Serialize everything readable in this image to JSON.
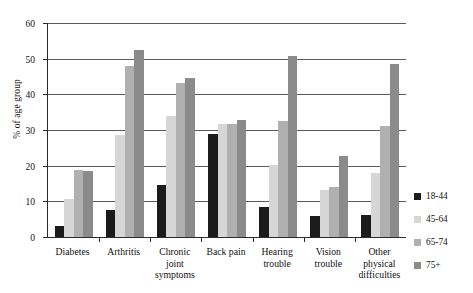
{
  "chart_data": {
    "type": "bar",
    "title": "",
    "subtitle": "",
    "xlabel": "",
    "ylabel": "% of age group",
    "ylim": [
      0,
      60
    ],
    "yticks": [
      0,
      10,
      20,
      30,
      40,
      50,
      60
    ],
    "ytick_labels": [
      "0",
      "10",
      "20",
      "30",
      "40",
      "50",
      "60"
    ],
    "grid": true,
    "legend_position": "right",
    "categories": [
      "Diabetes",
      "Arthritis",
      "Chronic\njoint\nsymptoms",
      "Back pain",
      "Hearing\ntrouble",
      "Vision\ntrouble",
      "Other\nphysical\ndifficulties"
    ],
    "series": [
      {
        "name": "18-44",
        "color": "#1b1b1b",
        "values": [
          3.0,
          7.5,
          14.7,
          29.0,
          8.3,
          6.0,
          6.3
        ]
      },
      {
        "name": "45-64",
        "color": "#d6d6d6",
        "values": [
          10.7,
          28.5,
          34.0,
          31.8,
          20.3,
          13.2,
          18.0
        ]
      },
      {
        "name": "65-74",
        "color": "#b0b0b0",
        "values": [
          18.8,
          48.0,
          43.3,
          31.8,
          32.5,
          14.0,
          31.0
        ]
      },
      {
        "name": "75+",
        "color": "#8b8b8b",
        "values": [
          18.6,
          52.5,
          44.5,
          32.8,
          50.7,
          22.8,
          48.6
        ]
      }
    ]
  },
  "axis": {
    "y_title": "% of age group"
  },
  "colors": {
    "axis": "#2b2b2b",
    "gridline": "#5a5a5a",
    "background": "#ffffff"
  }
}
